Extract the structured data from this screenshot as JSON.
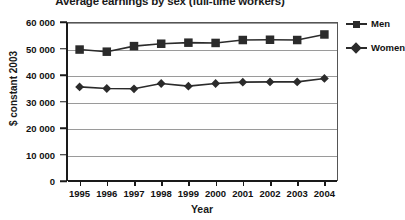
{
  "chart_data": {
    "type": "line",
    "title": "Average earnings by sex (full-time workers)",
    "xlabel": "Year",
    "ylabel": "$ constant 2003",
    "categories": [
      "1995",
      "1996",
      "1997",
      "1998",
      "1999",
      "2000",
      "2001",
      "2002",
      "2003",
      "2004"
    ],
    "series": [
      {
        "name": "Men",
        "marker": "square",
        "color": "#2b2b2b",
        "values": [
          49600,
          48800,
          50900,
          51800,
          52200,
          52100,
          53200,
          53300,
          53200,
          55300
        ]
      },
      {
        "name": "Women",
        "marker": "diamond",
        "color": "#2b2b2b",
        "values": [
          35500,
          34900,
          34800,
          36800,
          35800,
          36800,
          37300,
          37400,
          37400,
          38700
        ]
      }
    ],
    "ylim": [
      0,
      60000
    ],
    "yticks": [
      0,
      10000,
      20000,
      30000,
      40000,
      50000,
      60000
    ],
    "ytick_labels": [
      "0",
      "10 000",
      "20 000",
      "30 000",
      "40 000",
      "50 000",
      "60 000"
    ],
    "grid": true,
    "legend_position": "right"
  }
}
